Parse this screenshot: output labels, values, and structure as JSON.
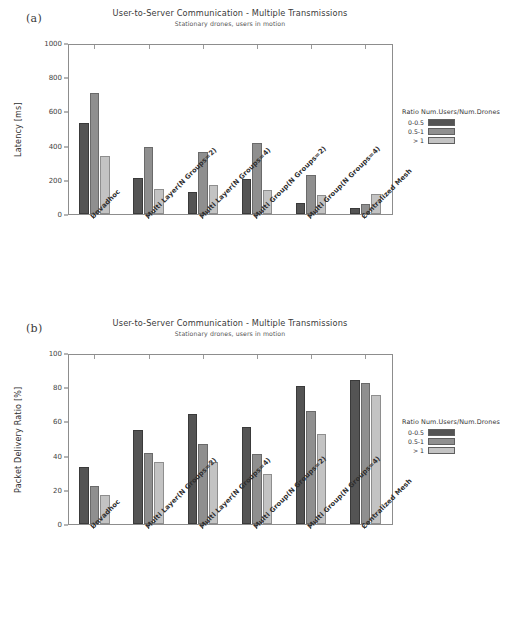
{
  "figure": {
    "panels": [
      {
        "panel_label": "(a)",
        "legend_title": "Ratio Num.Users/Num.Drones"
      },
      {
        "panel_label": "(b)",
        "legend_title": "Ratio Num.Users/Num.Drones"
      }
    ]
  },
  "chart_data": [
    {
      "type": "bar",
      "panel": "(a)",
      "title": "User-to-Server Communication - Multiple Transmissions",
      "subtitle": "Stationary drones, users in motion",
      "xlabel": "",
      "ylabel": "Latency [ms]",
      "ylim": [
        0,
        1000
      ],
      "yticks": [
        0,
        200,
        400,
        600,
        800,
        1000
      ],
      "ytick_labels": [
        "0",
        "200",
        "400",
        "600",
        "800",
        "1000"
      ],
      "grid": false,
      "legend_position": "right",
      "legend_title": "Ratio Num.Users/Num.Drones",
      "categories": [
        "Unvadhoc",
        "Multi Layer(N Groups=2)",
        "Multi Layer(N Groups=4)",
        "Multi Group(N Groups=2)",
        "Multi Group(N Groups=4)",
        "Centralized Mesh"
      ],
      "series": [
        {
          "name": "0-0.5",
          "color": "#545454",
          "values": [
            530,
            212,
            126,
            206,
            63,
            36
          ]
        },
        {
          "name": "0.5-1",
          "color": "#8f8f8f",
          "values": [
            710,
            392,
            362,
            416,
            228,
            58
          ]
        },
        {
          "name": "> 1",
          "color": "#c3c3c3",
          "values": [
            342,
            146,
            170,
            143,
            109,
            116
          ]
        }
      ]
    },
    {
      "type": "bar",
      "panel": "(b)",
      "title": "User-to-Server Communication - Multiple Transmissions",
      "subtitle": "Stationary drones, users in motion",
      "xlabel": "",
      "ylabel": "Packet Delivery Ratio [%]",
      "ylim": [
        0,
        100
      ],
      "yticks": [
        0,
        20,
        40,
        60,
        80,
        100
      ],
      "ytick_labels": [
        "0",
        "20",
        "40",
        "60",
        "80",
        "100"
      ],
      "grid": false,
      "legend_position": "right",
      "legend_title": "Ratio Num.Users/Num.Drones",
      "categories": [
        "Unvadhoc",
        "Multi Layer(N Groups=2)",
        "Multi Layer(N Groups=4)",
        "Multi Group(N Groups=2)",
        "Multi Group(N Groups=4)",
        "Centralized Mesh"
      ],
      "series": [
        {
          "name": "0-0.5",
          "color": "#545454",
          "values": [
            33.5,
            55.0,
            64.5,
            57.0,
            81.0,
            84.0
          ]
        },
        {
          "name": "0.5-1",
          "color": "#8f8f8f",
          "values": [
            22.0,
            41.5,
            47.0,
            41.0,
            66.0,
            82.5
          ]
        },
        {
          "name": "> 1",
          "color": "#c3c3c3",
          "values": [
            17.0,
            36.0,
            36.0,
            29.5,
            52.5,
            75.5
          ]
        }
      ]
    }
  ]
}
